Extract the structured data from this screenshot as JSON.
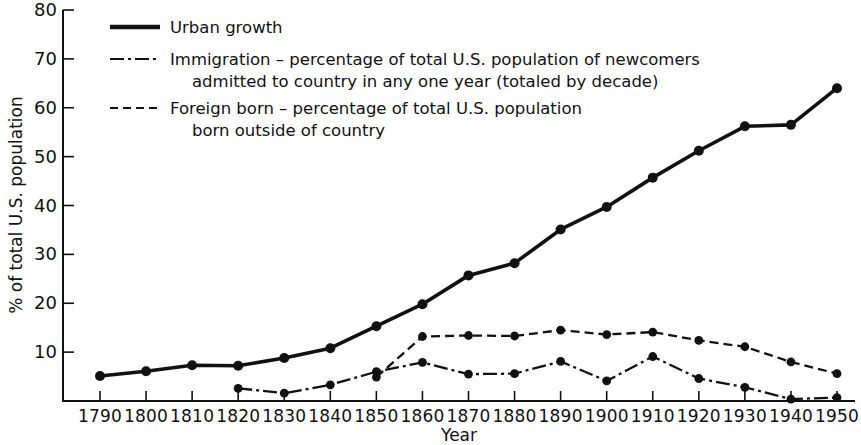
{
  "chart_data": {
    "type": "line",
    "title": "",
    "xlabel": "Year",
    "ylabel": "% of total U.S. population",
    "x": [
      1790,
      1800,
      1810,
      1820,
      1830,
      1840,
      1850,
      1860,
      1870,
      1880,
      1890,
      1900,
      1910,
      1920,
      1930,
      1940,
      1950
    ],
    "xtick_labels": [
      "1790",
      "1800",
      "1810",
      "1820",
      "1830",
      "1840",
      "1850",
      "1860",
      "1870",
      "1880",
      "1890",
      "1900",
      "1910",
      "1920",
      "1930",
      "1940",
      "1950"
    ],
    "ytick_labels": [
      "10",
      "20",
      "30",
      "40",
      "50",
      "60",
      "70",
      "80"
    ],
    "yticks": [
      10,
      20,
      30,
      40,
      50,
      60,
      70,
      80
    ],
    "xlim": [
      1790,
      1950
    ],
    "ylim": [
      0,
      80
    ],
    "grid": false,
    "legend_position": "top-left-inside",
    "series": [
      {
        "name": "Urban growth",
        "style": "solid",
        "legend_label": "Urban growth",
        "x": [
          1790,
          1800,
          1810,
          1820,
          1830,
          1840,
          1850,
          1860,
          1870,
          1880,
          1890,
          1900,
          1910,
          1920,
          1930,
          1940,
          1950
        ],
        "values": [
          5.1,
          6.1,
          7.3,
          7.2,
          8.8,
          10.8,
          15.3,
          19.8,
          25.7,
          28.2,
          35.1,
          39.7,
          45.7,
          51.2,
          56.2,
          56.5,
          64.0
        ]
      },
      {
        "name": "Immigration",
        "style": "dash-dot",
        "legend_label": "Immigration – percentage of total U.S. population of newcomers",
        "legend_label_line2": "admitted to country in any one year (totaled by decade)",
        "x": [
          1820,
          1830,
          1840,
          1850,
          1860,
          1870,
          1880,
          1890,
          1900,
          1910,
          1920,
          1930,
          1940,
          1950
        ],
        "values": [
          2.6,
          1.6,
          3.3,
          6.0,
          7.9,
          5.5,
          5.6,
          8.1,
          4.1,
          9.1,
          4.6,
          2.8,
          0.4,
          0.7
        ]
      },
      {
        "name": "Foreign born",
        "style": "dashed",
        "legend_label": "Foreign born – percentage of total U.S. population",
        "legend_label_line2": "born outside of country",
        "x": [
          1850,
          1860,
          1870,
          1880,
          1890,
          1900,
          1910,
          1920,
          1930,
          1940,
          1950
        ],
        "values": [
          4.9,
          13.2,
          13.4,
          13.3,
          14.5,
          13.6,
          14.1,
          12.4,
          11.1,
          8.0,
          5.6
        ]
      }
    ]
  },
  "legend": {
    "entries": [
      {
        "swatch": "solid-line-swatch",
        "line1": "Urban growth",
        "line2": ""
      },
      {
        "swatch": "dash-dot-line-swatch",
        "line1": "Immigration – percentage of total U.S. population of newcomers",
        "line2": "admitted to country in any one year (totaled by decade)"
      },
      {
        "swatch": "dashed-line-swatch",
        "line1": "Foreign born – percentage of total U.S. population",
        "line2": "born outside of country"
      }
    ]
  },
  "axes": {
    "y_axis_title": "% of total U.S. population",
    "x_axis_title": "Year"
  }
}
